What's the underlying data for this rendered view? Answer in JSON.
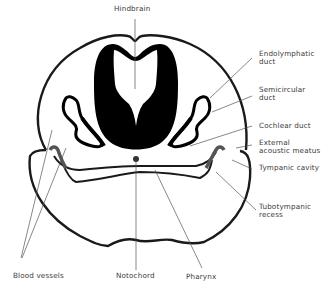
{
  "figure": {
    "type": "anatomical-cross-section",
    "colors": {
      "outline": "#1a1a1a",
      "fill_dark": "#000000",
      "leader": "#555555",
      "text": "#3a3a3a",
      "background": "#ffffff"
    }
  },
  "labels": {
    "hindbrain": "Hindbrain",
    "endolymphatic_duct_1": "Endolymphatic",
    "endolymphatic_duct_2": "duct",
    "semicircular_duct_1": "Semicircular",
    "semicircular_duct_2": "duct",
    "cochlear_duct": "Cochlear duct",
    "external_acoustic_meatus_1": "External",
    "external_acoustic_meatus_2": "acoustic meatus",
    "tympanic_cavity": "Tympanic cavity",
    "tubotympanic_recess_1": "Tubotympanic",
    "tubotympanic_recess_2": "recess",
    "blood_vessels": "Blood vessels",
    "notochord": "Notochord",
    "pharynx": "Pharynx"
  }
}
